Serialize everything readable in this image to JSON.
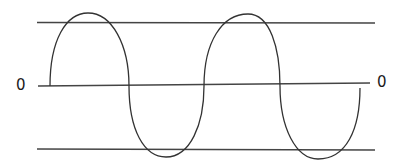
{
  "diagram": {
    "type": "sine-wave",
    "labels": {
      "zero_left": "0",
      "zero_right": "0"
    },
    "reference_lines": [
      {
        "name": "upper-bound",
        "y_left": 22,
        "y_right": 23,
        "x_start": 37,
        "x_end": 375
      },
      {
        "name": "zero-axis",
        "y_left": 86,
        "y_right": 83,
        "x_start": 38,
        "x_end": 370
      },
      {
        "name": "lower-bound",
        "y_left": 149,
        "y_right": 150,
        "x_start": 37,
        "x_end": 375
      }
    ],
    "wave": {
      "cycles": 2,
      "start_x": 50,
      "end_x": 360,
      "peaks": [
        {
          "x": 88,
          "y": 13
        },
        {
          "x": 250,
          "y": 14
        }
      ],
      "troughs": [
        {
          "x": 166,
          "y": 157
        },
        {
          "x": 318,
          "y": 159
        }
      ],
      "zero_crossings": [
        50,
        129,
        204,
        280
      ]
    },
    "colors": {
      "stroke": "#333333",
      "label": "#1a1a1a",
      "background": "#ffffff"
    }
  }
}
